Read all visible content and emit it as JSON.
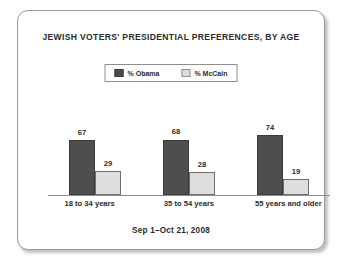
{
  "card": {
    "title": "JEWISH VOTERS' PRESIDENTIAL PREFERENCES, BY AGE",
    "footer": "Sep 1–Oct 21, 2008"
  },
  "legend": {
    "entries": [
      {
        "label": "% Obama",
        "color": "#4e4e4e"
      },
      {
        "label": "% McCain",
        "color": "#dedede"
      }
    ]
  },
  "chart_data": {
    "type": "bar",
    "title": "JEWISH VOTERS' PRESIDENTIAL PREFERENCES, BY AGE",
    "subtitle": "Sep 1–Oct 21, 2008",
    "xlabel": "",
    "ylabel": "",
    "ylim": [
      0,
      80
    ],
    "grid": false,
    "legend_position": "top-center",
    "categories": [
      "18 to 34 years",
      "35 to 54 years",
      "55 years and older"
    ],
    "series": [
      {
        "name": "% Obama",
        "color": "#4e4e4e",
        "values": [
          67,
          68,
          74
        ]
      },
      {
        "name": "% McCain",
        "color": "#dedede",
        "values": [
          29,
          28,
          19
        ]
      }
    ]
  }
}
